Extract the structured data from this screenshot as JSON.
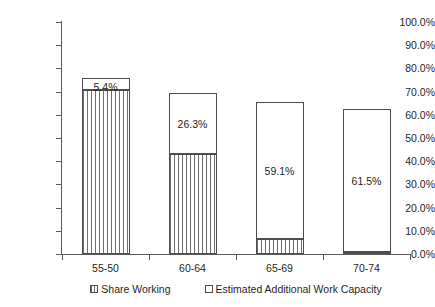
{
  "chart_data": {
    "type": "bar",
    "stacked": true,
    "title": "",
    "xlabel": "",
    "ylabel": "",
    "categories": [
      "55-50",
      "60-64",
      "65-69",
      "70-74"
    ],
    "series": [
      {
        "name": "Share Working",
        "swatch": "hatched",
        "values": [
          70.5,
          43.1,
          6.5,
          0.9
        ],
        "value_labels": [
          "",
          "",
          "",
          ""
        ]
      },
      {
        "name": "Estimated Additional Work Capacity",
        "swatch": "white",
        "values": [
          5.4,
          26.3,
          59.1,
          61.5
        ],
        "value_labels": [
          "5.4%",
          "26.3%",
          "59.1%",
          "61.5%"
        ]
      }
    ],
    "ylim": [
      0,
      100
    ],
    "ytick_values": [
      0,
      10,
      20,
      30,
      40,
      50,
      60,
      70,
      80,
      90,
      100
    ],
    "ytick_labels": [
      "0.0%",
      "10.0%",
      "20.0%",
      "30.0%",
      "40.0%",
      "50.0%",
      "60.0%",
      "70.0%",
      "80.0%",
      "90.0%",
      "100.0%"
    ],
    "grid": false,
    "legend_position": "bottom",
    "legend": [
      "Share Working",
      "Estimated Additional Work Capacity"
    ],
    "colors": {
      "axis": "#5a5a5a",
      "bar_border": "#4d4d4d",
      "hatch": "#6e6e6e",
      "fill": "#ffffff",
      "text": "#1f1f1f"
    }
  }
}
